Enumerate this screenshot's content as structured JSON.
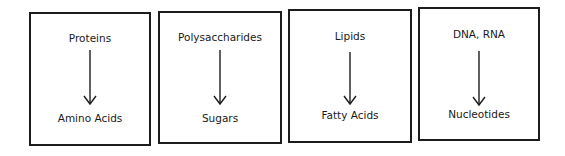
{
  "diagram": {
    "type": "breakdown-of-macromolecules",
    "boxes": [
      {
        "top": "Proteins",
        "bottom": "Amino Acids"
      },
      {
        "top": "Polysaccharides",
        "bottom": "Sugars"
      },
      {
        "top": "Lipids",
        "bottom": "Fatty Acids"
      },
      {
        "top": "DNA, RNA",
        "bottom": "Nucleotides"
      }
    ],
    "arrow_direction": "down",
    "colors": {
      "stroke": "#1c1c1c",
      "background": "#ffffff",
      "text": "#1a1a1a"
    }
  }
}
